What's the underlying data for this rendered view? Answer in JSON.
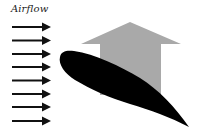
{
  "diagram": {
    "label": "Airflow",
    "colors": {
      "airflow_arrows": "#111111",
      "lift_arrow": "#a9a9a9",
      "airfoil": "#000000",
      "background": "#ffffff"
    },
    "airflow_arrows": {
      "count": 8,
      "y_positions": [
        27,
        40.5,
        54,
        67,
        80.5,
        94,
        107,
        121
      ],
      "x_start": 12,
      "x_end": 51
    },
    "lift_arrow": {
      "direction": "up",
      "meaning": "lift"
    },
    "airfoil": {
      "orientation": "angled down toward trailing edge"
    }
  }
}
